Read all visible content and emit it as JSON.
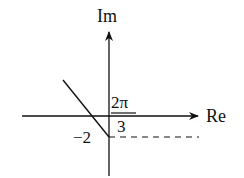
{
  "diagram": {
    "type": "complex-plane",
    "axes": {
      "vertical_label": "Im",
      "horizontal_label": "Re"
    },
    "labels": {
      "fraction_numerator": "2π",
      "fraction_denominator": "3",
      "imag_intercept": "−2"
    },
    "elements": [
      {
        "kind": "ray",
        "description": "line from point -2i going up-left at angle 2π/3 to the horizontal"
      },
      {
        "kind": "dashed-line",
        "description": "horizontal dashed reference line at Im = -2 to the right"
      }
    ],
    "colors": {
      "line": "#111111",
      "background": "#ffffff"
    }
  }
}
